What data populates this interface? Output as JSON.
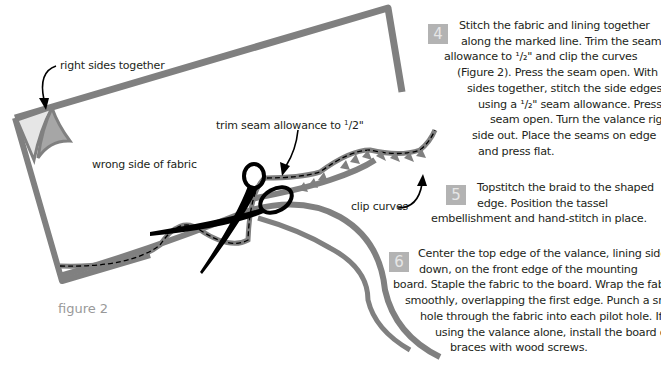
{
  "figure": {
    "caption": "figure 2",
    "labels": {
      "right_sides": "right sides together",
      "wrong_side": "wrong side of fabric",
      "trim_prefix": "trim seam allowance to ",
      "trim_num": "1",
      "trim_den": "/2\"",
      "clip": "clip curves"
    },
    "colors": {
      "fabric_outline": "#808080",
      "corner_light": "#e6e6e6",
      "corner_dark": "#a6a6a6",
      "scissors": "#000000",
      "step_box": "#b3b3b3",
      "caption": "#999999"
    }
  },
  "steps": [
    {
      "number": "4",
      "lines": [
        "Stitch the fabric and lining together",
        "along the marked line. Trim the seam",
        "allowance to ¹/₂\" and clip the curves",
        "(Figure 2). Press the seam open. With right",
        "sides together, stitch the side edges",
        "using a ¹/₂\" seam allowance. Press the",
        "seam open. Turn the valance right",
        "side out. Place the seams on edge",
        "and press flat."
      ]
    },
    {
      "number": "5",
      "lines": [
        "Topstitch the braid to the shaped",
        "edge. Position the tassel",
        "embellishment and hand-stitch in place."
      ]
    },
    {
      "number": "6",
      "lines": [
        "Center the top edge of the valance, lining side",
        "down, on the front edge of the mounting",
        "board. Staple the fabric to the board. Wrap the fabric",
        "smoothly, overlapping the first edge. Punch a small",
        "hole through the fabric into each pilot hole. If",
        "using the valance alone, install the board on",
        "braces with wood screws."
      ]
    }
  ]
}
